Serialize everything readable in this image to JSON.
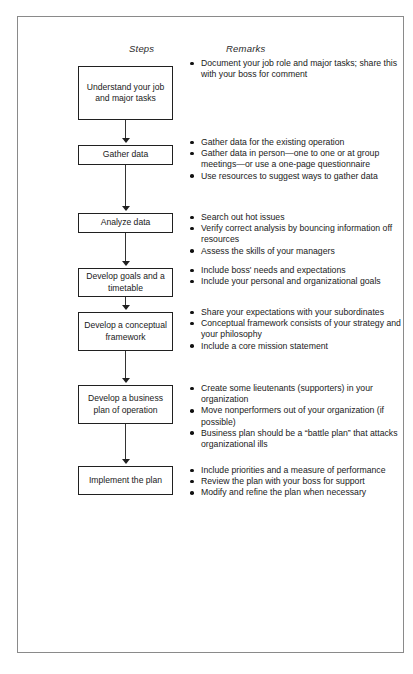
{
  "page": {
    "border_color": "#8a8a8a",
    "background": "#ffffff"
  },
  "headings": {
    "steps": "Steps",
    "remarks": "Remarks"
  },
  "flow": {
    "box_border_color": "#202020",
    "connector_color": "#333333",
    "steps": [
      {
        "label": "Understand your job and major tasks",
        "top": 22,
        "height": 54
      },
      {
        "label": "Gather data",
        "top": 101,
        "height": 20
      },
      {
        "label": "Analyze data",
        "top": 169,
        "height": 20
      },
      {
        "label": "Develop goals and a timetable",
        "top": 224,
        "height": 29
      },
      {
        "label": "Develop a conceptual framework",
        "top": 268,
        "height": 39
      },
      {
        "label": "Develop a business plan of operation",
        "top": 341,
        "height": 39
      },
      {
        "label": "Implement the plan",
        "top": 422,
        "height": 29
      }
    ],
    "connectors": [
      {
        "top": 76,
        "height": 21
      },
      {
        "top": 121,
        "height": 44
      },
      {
        "top": 189,
        "height": 31
      },
      {
        "top": 253,
        "height": 11
      },
      {
        "top": 307,
        "height": 30
      },
      {
        "top": 380,
        "height": 38
      }
    ],
    "arrowheads": [
      {
        "top": 94
      },
      {
        "top": 162
      },
      {
        "top": 217
      },
      {
        "top": 261
      },
      {
        "top": 334
      },
      {
        "top": 415
      }
    ]
  },
  "remarks": {
    "groups": [
      {
        "top": 14,
        "items": [
          "Document your job role and major tasks; share this with your boss for comment"
        ]
      },
      {
        "top": 93,
        "items": [
          "Gather data for the existing operation",
          "Gather data in person—one to one or at group meetings—or use a one-page questionnaire",
          "Use resources to suggest ways to gather data"
        ]
      },
      {
        "top": 168,
        "items": [
          "Search out hot issues",
          "Verify correct analysis by bouncing information off resources",
          "Assess the skills of your managers"
        ]
      },
      {
        "top": 221,
        "items": [
          "Include boss' needs and expectations",
          "Include your personal and organizational goals"
        ]
      },
      {
        "top": 263,
        "items": [
          "Share your expectations with your subordinates",
          "Conceptual framework consists of your strategy and your philosophy",
          "Include a core mission statement"
        ]
      },
      {
        "top": 339,
        "items": [
          "Create some lieutenants (supporters) in your organization",
          "Move nonperformers out of your organization (if possible)",
          "Business plan should be a “battle plan” that attacks organizational ills"
        ]
      },
      {
        "top": 421,
        "items": [
          "Include priorities and a measure of performance",
          "Review the plan with your boss for support",
          "Modify and refine the plan when necessary"
        ]
      }
    ]
  }
}
